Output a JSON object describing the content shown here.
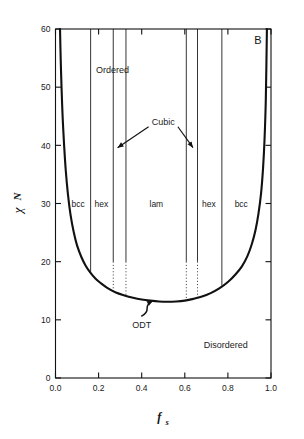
{
  "panel": {
    "label": "B"
  },
  "axes": {
    "x": {
      "title": "f",
      "subscript": "s",
      "min": 0.0,
      "max": 1.0,
      "ticks": [
        0.0,
        0.2,
        0.4,
        0.6,
        0.8,
        1.0
      ],
      "tick_labels": [
        "0.0",
        "0.2",
        "0.4",
        "0.6",
        "0.8",
        "1.0"
      ]
    },
    "y": {
      "title_symbol": "χ",
      "title_suffix": "N",
      "min": 0,
      "max": 60,
      "ticks": [
        0,
        10,
        20,
        30,
        40,
        50,
        60
      ],
      "tick_labels": [
        "0",
        "10",
        "20",
        "30",
        "40",
        "50",
        "60"
      ]
    },
    "frame": true,
    "grid": false
  },
  "chart_data": {
    "type": "line",
    "title": "",
    "xlabel": "f_s",
    "ylabel": "chi N",
    "xlim": [
      0.0,
      1.0
    ],
    "ylim": [
      0,
      60
    ],
    "grid": false,
    "legend_position": "none",
    "series": [
      {
        "name": "ODT (order-disorder transition)",
        "style": "solid-thick",
        "x": [
          0.021,
          0.024,
          0.028,
          0.033,
          0.04,
          0.048,
          0.058,
          0.07,
          0.085,
          0.1,
          0.12,
          0.14,
          0.16,
          0.185,
          0.21,
          0.24,
          0.28,
          0.32,
          0.36,
          0.4,
          0.44,
          0.48,
          0.52,
          0.56,
          0.6,
          0.64,
          0.68,
          0.72,
          0.76,
          0.8,
          0.835,
          0.865,
          0.89,
          0.91,
          0.928,
          0.942,
          0.954,
          0.963,
          0.97,
          0.976,
          0.981
        ],
        "y": [
          60.0,
          55.0,
          50.0,
          45.0,
          40.0,
          35.5,
          31.5,
          28.0,
          25.0,
          22.8,
          20.8,
          19.3,
          18.2,
          17.1,
          16.3,
          15.5,
          14.7,
          14.2,
          13.8,
          13.5,
          13.3,
          13.15,
          13.1,
          13.15,
          13.3,
          13.6,
          14.0,
          14.6,
          15.4,
          16.5,
          17.8,
          19.2,
          20.9,
          22.9,
          25.4,
          28.3,
          31.8,
          36.0,
          41.0,
          48.0,
          60.0
        ]
      }
    ],
    "phase_boundaries": [
      {
        "name": "bcc-hex-left",
        "x": 0.163,
        "y_top": 60,
        "y_solid_bottom": 17.9,
        "dotted": false
      },
      {
        "name": "hex-cubic-left",
        "x": 0.268,
        "y_top": 60,
        "y_solid_bottom": 20.0,
        "y_dotted_bottom": 14.9,
        "dotted": true
      },
      {
        "name": "cubic-lam-left",
        "x": 0.327,
        "y_top": 60,
        "y_solid_bottom": 20.0,
        "y_dotted_bottom": 14.1,
        "dotted": true
      },
      {
        "name": "lam-cubic-right",
        "x": 0.607,
        "y_top": 60,
        "y_solid_bottom": 20.0,
        "y_dotted_bottom": 13.4,
        "dotted": true
      },
      {
        "name": "cubic-hex-right",
        "x": 0.659,
        "y_top": 60,
        "y_solid_bottom": 20.0,
        "y_dotted_bottom": 13.8,
        "dotted": true
      },
      {
        "name": "hex-bcc-right",
        "x": 0.772,
        "y_top": 60,
        "y_solid_bottom": 15.9,
        "dotted": false
      }
    ],
    "phase_labels": [
      {
        "text": "bcc",
        "x": 0.105,
        "y": 30.0
      },
      {
        "text": "hex",
        "x": 0.213,
        "y": 30.0
      },
      {
        "text": "lam",
        "x": 0.468,
        "y": 30.0
      },
      {
        "text": "hex",
        "x": 0.712,
        "y": 30.0
      },
      {
        "text": "bcc",
        "x": 0.862,
        "y": 30.0
      }
    ],
    "annotations": [
      {
        "text": "Ordered",
        "x": 0.265,
        "y": 53.0,
        "type": "region-label"
      },
      {
        "text": "Disordered",
        "x": 0.79,
        "y": 5.8,
        "type": "region-label"
      },
      {
        "text": "Cubic",
        "x": 0.5,
        "y": 44.0,
        "type": "callout",
        "arrows": [
          {
            "from_x": 0.432,
            "from_y": 43.2,
            "to_x": 0.288,
            "to_y": 39.6
          },
          {
            "from_x": 0.568,
            "from_y": 43.2,
            "to_x": 0.638,
            "to_y": 39.6
          }
        ]
      },
      {
        "text": "ODT",
        "x": 0.4,
        "y": 9.2,
        "type": "callout-squiggle",
        "arrows": [
          {
            "from_x": 0.398,
            "from_y": 10.6,
            "to_x": 0.452,
            "to_y": 13.3
          }
        ]
      }
    ]
  },
  "colors": {
    "line": "#111111",
    "frame": "#111111",
    "text": "#1a1a1a",
    "background": "#ffffff"
  }
}
